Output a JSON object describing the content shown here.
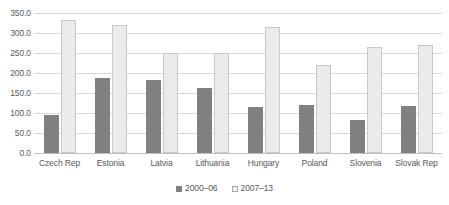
{
  "chart_data": {
    "type": "bar",
    "title": "",
    "subtitle": "",
    "xlabel": "",
    "ylabel": "",
    "ylim": [
      0,
      350
    ],
    "ytick_step": 50,
    "ytick_labels": [
      "0.0",
      "50.0",
      "100.0",
      "150.0",
      "200.0",
      "250.0",
      "300.0",
      "350.0"
    ],
    "ytick_values": [
      0,
      50,
      100,
      150,
      200,
      250,
      300,
      350
    ],
    "grid": true,
    "legend_position": "bottom-center",
    "categories": [
      "Czech Rep",
      "Estonia",
      "Latvia",
      "Lithuania",
      "Hungary",
      "Poland",
      "Slovenia",
      "Slovak Rep"
    ],
    "series": [
      {
        "name": "2000–06",
        "color": "#808080",
        "values": [
          95,
          188,
          183,
          163,
          115,
          121,
          83,
          118
        ]
      },
      {
        "name": "2007–13",
        "color": "#ebebeb",
        "values": [
          332,
          321,
          250,
          250,
          315,
          220,
          266,
          271
        ]
      }
    ]
  },
  "legend": {
    "items": [
      {
        "label": "2000–06"
      },
      {
        "label": "2007–13"
      }
    ]
  },
  "colors": {
    "series_0": "#808080",
    "series_1": "#ebebeb",
    "gridline": "#d9d9d9",
    "text": "#595959",
    "background": "#ffffff"
  }
}
